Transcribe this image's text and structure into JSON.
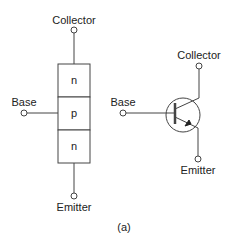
{
  "figure": {
    "caption": "(a)",
    "line_color": "#444444",
    "text_color": "#222222"
  },
  "layer_diagram": {
    "collector_label": "Collector",
    "base_label": "Base",
    "emitter_label": "Emitter",
    "layers": [
      {
        "label": "n"
      },
      {
        "label": "p"
      },
      {
        "label": "n"
      }
    ]
  },
  "symbol_diagram": {
    "type": "NPN bipolar junction transistor",
    "collector_label": "Collector",
    "base_label": "Base",
    "emitter_label": "Emitter"
  }
}
